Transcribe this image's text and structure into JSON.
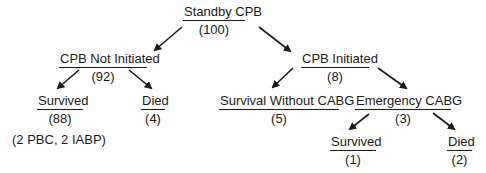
{
  "diagram": {
    "type": "tree",
    "root": {
      "label": "Standby CPB",
      "count": "(100)"
    },
    "level1": {
      "not_initiated": {
        "label": "CPB Not Initiated",
        "count": "(92)"
      },
      "initiated": {
        "label": "CPB Initiated",
        "count": "(8)"
      }
    },
    "level2": {
      "ni_survived": {
        "label": "Survived",
        "count": "(88)"
      },
      "ni_died": {
        "label": "Died",
        "count": "(4)"
      },
      "i_survival_without_cabg": {
        "label": "Survival Without CABG",
        "count": "(5)"
      },
      "i_emergency_cabg": {
        "label": "Emergency CABG",
        "count": "(3)"
      }
    },
    "level3": {
      "ec_survived": {
        "label": "Survived",
        "count": "(1)"
      },
      "ec_died": {
        "label": "Died",
        "count": "(2)"
      }
    },
    "note": "(2 PBC, 2 IABP)",
    "colors": {
      "ink": "#1a1a1a",
      "background": "#ffffff"
    }
  }
}
